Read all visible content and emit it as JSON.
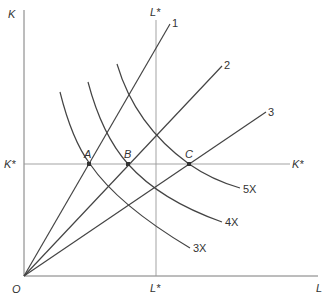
{
  "diagram": {
    "type": "isoquant-map",
    "axes": {
      "y_label": "K",
      "x_label": "L",
      "origin_label": "O"
    },
    "guides": {
      "capital_level": "K*",
      "labor_level_top": "L*",
      "labor_level_bottom": "L*",
      "capital_level_right": "K*"
    },
    "rays": [
      {
        "label": "1"
      },
      {
        "label": "2"
      },
      {
        "label": "3"
      }
    ],
    "isoquants": [
      {
        "label": "3X"
      },
      {
        "label": "4X"
      },
      {
        "label": "5X"
      }
    ],
    "points": [
      {
        "label": "A"
      },
      {
        "label": "B"
      },
      {
        "label": "C"
      }
    ]
  }
}
